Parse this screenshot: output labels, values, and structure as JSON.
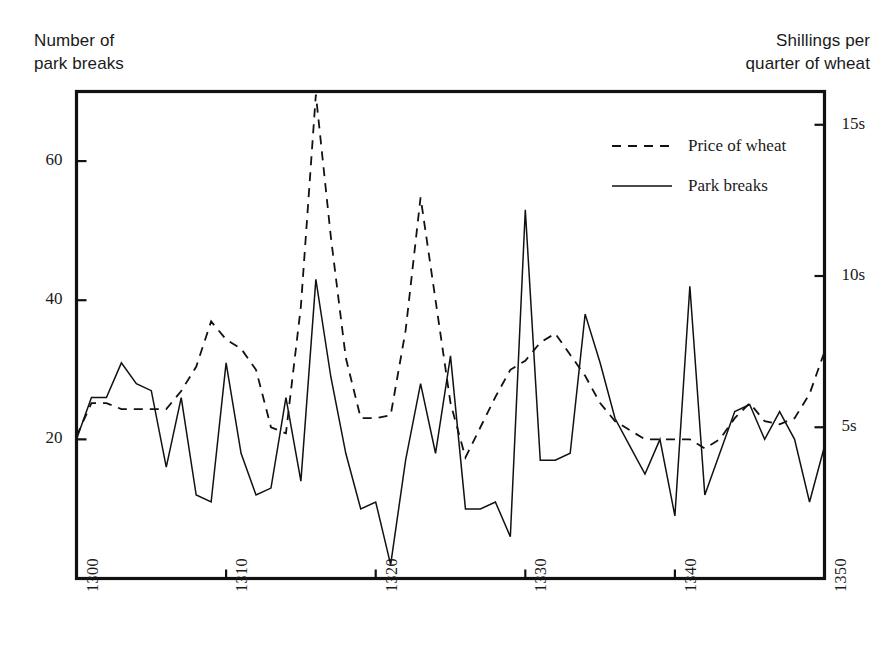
{
  "figure": {
    "left_axis_title": "Number of\npark breaks",
    "right_axis_title": "Shillings per\nquarter of wheat"
  },
  "legend": {
    "position": "top-right-inside",
    "entries": [
      {
        "label": "Price of wheat",
        "style": "dashed"
      },
      {
        "label": "Park breaks",
        "style": "solid"
      }
    ]
  },
  "axes": {
    "x_ticks": [
      "1300",
      "1310",
      "1320",
      "1330",
      "1340",
      "1350"
    ],
    "y_left_ticks": [
      "20",
      "40",
      "60"
    ],
    "y_right_ticks": [
      "5s",
      "10s",
      "15s"
    ]
  },
  "chart_data": {
    "type": "line",
    "title": "",
    "xlabel": "",
    "ylabel": "Number of park breaks",
    "y2label": "Shillings per quarter of wheat",
    "xlim": [
      1300,
      1350
    ],
    "ylim": [
      0,
      70
    ],
    "y2lim": [
      0,
      16.1
    ],
    "grid": false,
    "legend_position": "upper right",
    "x": [
      1300,
      1301,
      1302,
      1303,
      1304,
      1305,
      1306,
      1307,
      1308,
      1309,
      1310,
      1311,
      1312,
      1313,
      1314,
      1315,
      1316,
      1317,
      1318,
      1319,
      1320,
      1321,
      1322,
      1323,
      1324,
      1325,
      1326,
      1327,
      1328,
      1329,
      1330,
      1331,
      1332,
      1333,
      1334,
      1335,
      1336,
      1337,
      1338,
      1339,
      1340,
      1341,
      1342,
      1343,
      1344,
      1345,
      1346,
      1347,
      1348,
      1349,
      1350
    ],
    "series": [
      {
        "name": "Park breaks",
        "axis": "left",
        "style": "solid",
        "values": [
          20,
          26,
          26,
          31,
          28,
          27,
          16,
          26,
          12,
          11,
          31,
          18,
          12,
          13,
          26,
          14,
          43,
          29,
          18,
          10,
          11,
          2,
          17,
          28,
          18,
          32,
          10,
          10,
          11,
          6,
          53,
          17,
          17,
          18,
          38,
          31,
          23,
          19,
          15,
          20,
          9,
          42,
          12,
          18,
          24,
          25,
          20,
          24,
          20,
          11,
          19
        ]
      },
      {
        "name": "Price of wheat",
        "axis": "right",
        "style": "dashed",
        "values": [
          4.7,
          5.8,
          5.8,
          5.6,
          5.6,
          5.6,
          5.6,
          6.2,
          7.0,
          8.5,
          7.9,
          7.6,
          6.9,
          5.0,
          4.8,
          9.0,
          16.0,
          11.3,
          7.3,
          5.3,
          5.3,
          5.4,
          8.2,
          12.6,
          9.2,
          5.8,
          4.0,
          5.0,
          6.0,
          6.9,
          7.2,
          7.8,
          8.1,
          7.4,
          6.7,
          5.8,
          5.2,
          4.9,
          4.6,
          4.6,
          4.6,
          4.6,
          4.3,
          4.6,
          5.3,
          5.8,
          5.2,
          5.1,
          5.3,
          6.1,
          7.5
        ]
      }
    ]
  }
}
